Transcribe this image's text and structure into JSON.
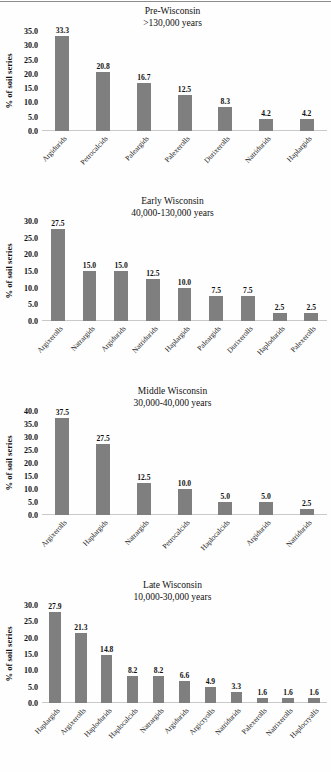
{
  "figure": {
    "y_axis_label": "% of soil series",
    "bar_color": "#7f7f7f",
    "baseline_color": "#c9c9c9"
  },
  "chart_data": [
    {
      "type": "bar",
      "title": "Pre-Wisconsin",
      "subtitle": ">130,000 years",
      "ylabel": "% of soil series",
      "xlabel": "",
      "ylim": [
        0,
        35
      ],
      "ytick_step": 5,
      "yticks": [
        "0.0",
        "5.0",
        "10.0",
        "15.0",
        "20.0",
        "25.0",
        "30.0",
        "35.0"
      ],
      "grid": false,
      "legend": "none",
      "categories": [
        "Argidurids",
        "Petrocalcids",
        "Paleargids",
        "Palexerolls",
        "Durixerolls",
        "Natridurids",
        "Haplargids"
      ],
      "values": [
        33.3,
        20.8,
        16.7,
        12.5,
        8.3,
        4.2,
        4.2
      ],
      "labels": [
        "33.3",
        "20.8",
        "16.7",
        "12.5",
        "8.3",
        "4.2",
        "4.2"
      ]
    },
    {
      "type": "bar",
      "title": "Early Wisconsin",
      "subtitle": "40,000-130,000  years",
      "ylabel": "% of soil series",
      "xlabel": "",
      "ylim": [
        0,
        30
      ],
      "ytick_step": 5,
      "yticks": [
        "0.0",
        "5.0",
        "10.0",
        "15.0",
        "20.0",
        "25.0",
        "30.0"
      ],
      "grid": false,
      "legend": "none",
      "categories": [
        "Argixerolls",
        "Natrargids",
        "Argidurids",
        "Natridurids",
        "Haplargids",
        "Paleargids",
        "Durixerolls",
        "Haplodurids",
        "Palexerolls"
      ],
      "values": [
        27.5,
        15.0,
        15.0,
        12.5,
        10.0,
        7.5,
        7.5,
        2.5,
        2.5
      ],
      "labels": [
        "27.5",
        "15.0",
        "15.0",
        "12.5",
        "10.0",
        "7.5",
        "7.5",
        "2.5",
        "2.5"
      ]
    },
    {
      "type": "bar",
      "title": "Middle Wisconsin",
      "subtitle": "30,000-40,000  years",
      "ylabel": "% of soil series",
      "xlabel": "",
      "ylim": [
        0,
        40
      ],
      "ytick_step": 5,
      "yticks": [
        "0.0",
        "5.0",
        "10.0",
        "15.0",
        "20.0",
        "25.0",
        "30.0",
        "35.0",
        "40.0"
      ],
      "grid": false,
      "legend": "none",
      "categories": [
        "Argixerolls",
        "Haplargids",
        "Natrargids",
        "Petrocalcids",
        "Haplocalcids",
        "Argidurids",
        "Natridurids"
      ],
      "values": [
        37.5,
        27.5,
        12.5,
        10.0,
        5.0,
        5.0,
        2.5
      ],
      "labels": [
        "37.5",
        "27.5",
        "12.5",
        "10.0",
        "5.0",
        "5.0",
        "2.5"
      ]
    },
    {
      "type": "bar",
      "title": "Late Wisconsin",
      "subtitle": "10,000-30,000  years",
      "ylabel": "% of soil series",
      "xlabel": "",
      "ylim": [
        0,
        30
      ],
      "ytick_step": 5,
      "yticks": [
        "0.0",
        "5.0",
        "10.0",
        "15.0",
        "20.0",
        "25.0",
        "30.0"
      ],
      "grid": false,
      "legend": "none",
      "categories": [
        "Haplargids",
        "Argixerolls",
        "Haplodurids",
        "Haplocalcids",
        "Natrargids",
        "Argidurids",
        "Argicryolls",
        "Natridurids",
        "Palexerolls",
        "Natrixerolls",
        "Haplocryalfs"
      ],
      "values": [
        27.9,
        21.3,
        14.8,
        8.2,
        8.2,
        6.6,
        4.9,
        3.3,
        1.6,
        1.6,
        1.6
      ],
      "labels": [
        "27.9",
        "21.3",
        "14.8",
        "8.2",
        "8.2",
        "6.6",
        "4.9",
        "3.3",
        "1.6",
        "1.6",
        "1.6"
      ]
    }
  ]
}
